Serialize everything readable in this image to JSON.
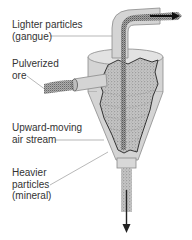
{
  "diagram": {
    "type": "cyclone-separator",
    "colors": {
      "background": "#ffffff",
      "body_fill": "#d4d4d4",
      "body_stroke": "#8a8a8a",
      "cutaway_fill": "#bdbdbd",
      "cutaway_edge": "#222222",
      "particle": "#3a3a3a",
      "leader_line": "#9a9a9a",
      "label_text": "#333333"
    },
    "labels": {
      "lighter_particles": {
        "line1": "Lighter particles",
        "line2": "(gangue)"
      },
      "pulverized_ore": {
        "line1": "Pulverized",
        "line2": "ore"
      },
      "air_stream": {
        "line1": "Upward-moving",
        "line2": "air stream"
      },
      "heavier_particles": {
        "line1": "Heavier",
        "line2": "particles",
        "line3": "(mineral)"
      }
    },
    "arrows": {
      "top_outlet": "arrow-right-icon",
      "bottom_outlet": "arrow-down-icon"
    }
  }
}
